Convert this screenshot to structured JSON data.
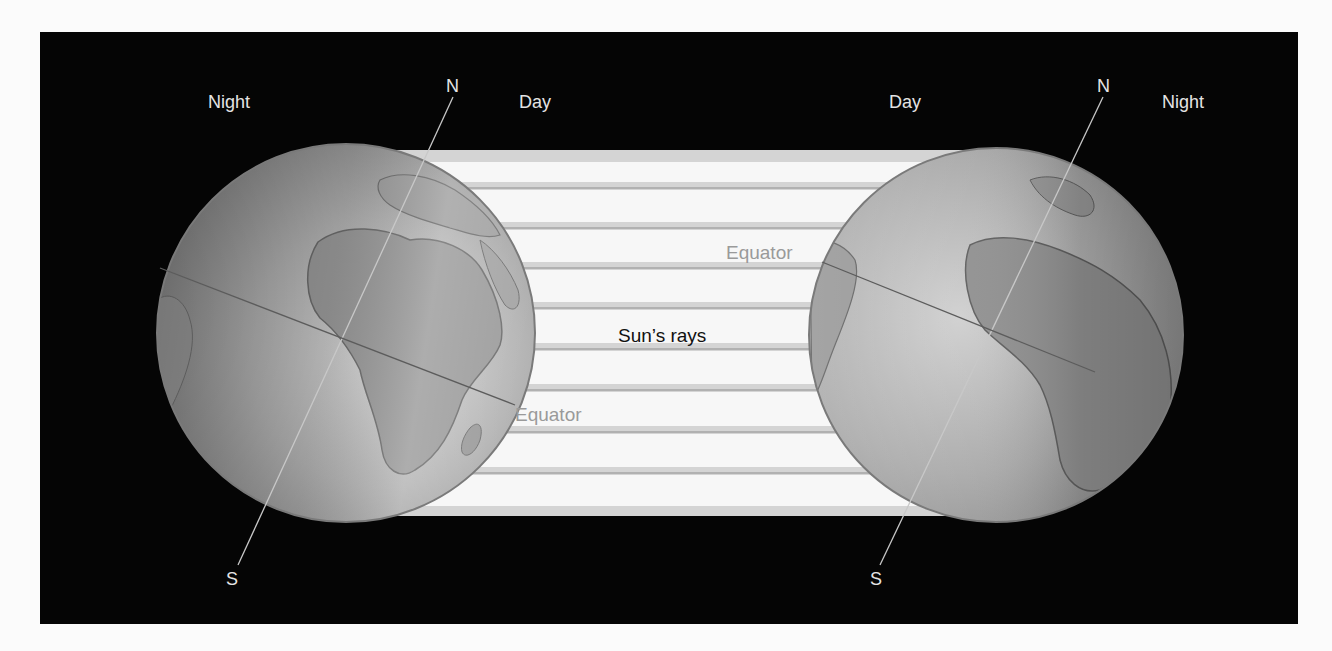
{
  "diagram": {
    "type": "earth-illumination",
    "background_color": "#050505",
    "left_globe": {
      "labels": {
        "night": "Night",
        "day": "Day",
        "north": "N",
        "south": "S",
        "equator": "Equator"
      }
    },
    "right_globe": {
      "labels": {
        "day": "Day",
        "night": "Night",
        "north": "N",
        "south": "S",
        "equator": "Equator"
      }
    },
    "rays": {
      "label": "Sun’s rays"
    }
  }
}
